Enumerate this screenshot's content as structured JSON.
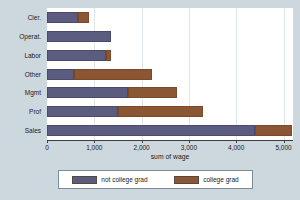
{
  "chart_data": {
    "type": "bar",
    "orientation": "horizontal",
    "stacked": true,
    "title": "",
    "xlabel": "sum of wage",
    "ylabel": "",
    "xlim": [
      0,
      5200
    ],
    "xticks": [
      0,
      1000,
      2000,
      3000,
      4000,
      5000
    ],
    "xticklabels": [
      "0",
      "1,000",
      "2,000",
      "3,000",
      "4,000",
      "5,000"
    ],
    "grid": true,
    "grid_axis": "x",
    "legend_position": "bottom",
    "categories": [
      "Cler.",
      "Operat.",
      "Labor",
      "Other",
      "Mgmt",
      "Prof",
      "Sales"
    ],
    "series": [
      {
        "name": "not college grad",
        "color": "#5c5c80",
        "values": [
          650,
          1360,
          1240,
          570,
          1720,
          1510,
          4400
        ]
      },
      {
        "name": "college grad",
        "color": "#8b5633",
        "values": [
          230,
          0,
          110,
          1660,
          1030,
          1780,
          780
        ]
      }
    ],
    "totals": [
      880,
      1360,
      1350,
      2230,
      2750,
      3290,
      5180
    ]
  },
  "legend": {
    "entries": [
      {
        "label": "not college grad",
        "color": "#5c5c80"
      },
      {
        "label": "college grad",
        "color": "#8b5633"
      }
    ]
  },
  "colors": {
    "background": "#cdd7de",
    "plot_background": "#ffffff",
    "gridline": "#dfe6ea",
    "axis": "#3d3d3d",
    "text": "#1a1a1a",
    "series_a": "#5c5c80",
    "series_b": "#8b5633"
  }
}
